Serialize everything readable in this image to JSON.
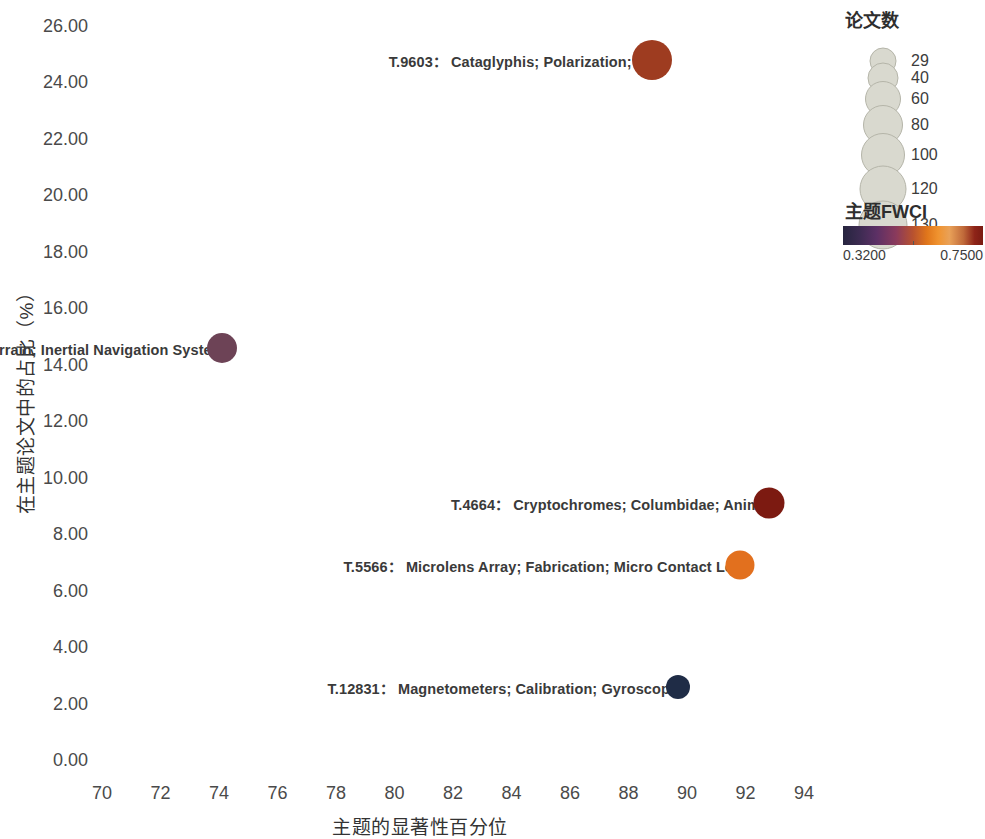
{
  "chart_data": {
    "type": "scatter",
    "title": "",
    "xlabel": "主题的显著性百分位",
    "ylabel": "在主题论文中的占比（%）",
    "xlim": [
      69,
      95
    ],
    "ylim": [
      0,
      26.8
    ],
    "xticks": [
      70,
      72,
      74,
      76,
      78,
      80,
      82,
      84,
      86,
      88,
      90,
      92,
      94
    ],
    "xtick_labels": [
      "70",
      "72",
      "74",
      "76",
      "78",
      "80",
      "82",
      "84",
      "86",
      "88",
      "90",
      "92",
      "94"
    ],
    "yticks": [
      0,
      2,
      4,
      6,
      8,
      10,
      12,
      14,
      16,
      18,
      20,
      22,
      24,
      26
    ],
    "ytick_labels": [
      "0.00",
      "2.00",
      "4.00",
      "6.00",
      "8.00",
      "10.00",
      "12.00",
      "14.00",
      "16.00",
      "18.00",
      "20.00",
      "22.00",
      "24.00",
      "26.00"
    ],
    "grid": false,
    "legend_position": "right",
    "size_encoding": "论文数",
    "color_encoding": "主题FWCI",
    "points": [
      {
        "id": "T.9603",
        "label": "T.9603：  Cataglyphis; Polarization; Ants",
        "x": 88.8,
        "y": 24.8,
        "size_px": 40,
        "color": "#9e3c20"
      },
      {
        "id": "T.13568",
        "label": "T.13568：  Underwater; Terrain; Inertial Navigation Systems",
        "x": 74.1,
        "y": 14.6,
        "size_px": 30,
        "color": "#6d4356"
      },
      {
        "id": "T.4664",
        "label": "T.4664：  Cryptochromes; Columbidae; Animals",
        "x": 92.8,
        "y": 9.1,
        "size_px": 31,
        "color": "#7c1a11"
      },
      {
        "id": "T.5566",
        "label": "T.5566：  Microlens Array; Fabrication; Micro Contact Lens",
        "x": 91.8,
        "y": 6.9,
        "size_px": 29,
        "color": "#e2701e"
      },
      {
        "id": "T.12831",
        "label": "T.12831：  Magnetometers; Calibration; Gyroscopes",
        "x": 89.7,
        "y": 2.6,
        "size_px": 24,
        "color": "#1f2c46"
      }
    ]
  },
  "size_legend": {
    "heading": "论文数",
    "items": [
      {
        "value": "29",
        "diameter_px": 25
      },
      {
        "value": "40",
        "diameter_px": 29
      },
      {
        "value": "60",
        "diameter_px": 34
      },
      {
        "value": "80",
        "diameter_px": 38
      },
      {
        "value": "100",
        "diameter_px": 42
      },
      {
        "value": "120",
        "diameter_px": 45
      },
      {
        "value": "130",
        "diameter_px": 47
      }
    ],
    "swatch_color": "#d9d9cf"
  },
  "color_legend": {
    "heading": "主题FWCI",
    "min_label": "0.3200",
    "max_label": "0.7500",
    "min_value": 0.32,
    "max_value": 0.75,
    "notch_position": 0.5
  }
}
